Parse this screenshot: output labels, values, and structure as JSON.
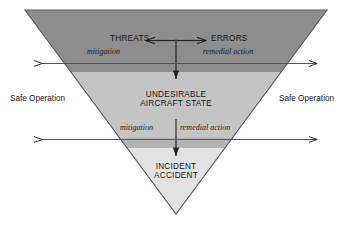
{
  "diagram": {
    "type": "inverted-triangle-flow",
    "background_color": "#ffffff",
    "bands": [
      {
        "name": "threats-errors-band",
        "label": "Threats and Errors layer",
        "color": "#8d8d8d"
      },
      {
        "name": "undesirable-state-band",
        "label": "Undesirable Aircraft State layer",
        "color": "#c4c4c4"
      },
      {
        "name": "incident-accident-band",
        "label": "Incident / Accident layer",
        "color": "#e2e2e2"
      }
    ],
    "outline_color": "#5a5a5a",
    "arrow_color": "#222222"
  },
  "nodes": {
    "threats": "THREATS",
    "errors": "ERRORS",
    "undesirable_line1": "UNDESIRABLE",
    "undesirable_line2": "AIRCRAFT STATE",
    "incident_line1": "INCIDENT",
    "incident_line2": "ACCIDENT"
  },
  "countermeasures": {
    "upper_mitigation": "mitigation",
    "upper_remedial": "remedial action",
    "lower_mitigation": "mitigation",
    "lower_remedial": "remedial action"
  },
  "side_labels": {
    "left": "Safe Operation",
    "right": "Safe Operation"
  },
  "arrows": {
    "threats_arrow": "left-arrow-to-threats",
    "errors_arrow": "right-arrow-to-errors",
    "upper_vertical": "down-arrow-to-undesirable-state",
    "lower_vertical": "down-arrow-to-incident-accident",
    "upper_horizontal": "safe-operation-span-upper",
    "lower_horizontal": "safe-operation-span-lower"
  }
}
